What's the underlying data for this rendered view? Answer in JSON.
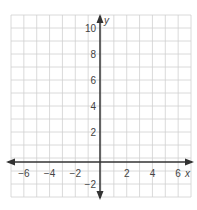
{
  "chart_data": {
    "type": "scatter",
    "title": "",
    "xlabel": "x",
    "ylabel": "y",
    "xlim": [
      -7,
      7
    ],
    "ylim": [
      -3,
      11
    ],
    "grid": true,
    "x_ticks": [
      "-6",
      "-4",
      "-2",
      "2",
      "4",
      "6"
    ],
    "y_ticks": [
      "10",
      "8",
      "6",
      "4",
      "2",
      "-2"
    ],
    "series": []
  },
  "colors": {
    "grid": "#d0d0d0",
    "axis": "#333333",
    "text": "#444444"
  }
}
